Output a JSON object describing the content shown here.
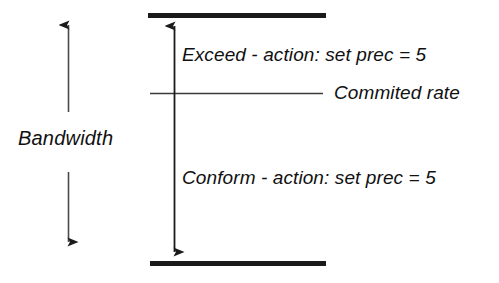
{
  "diagram": {
    "title_text_present": false,
    "labels": {
      "bandwidth": "Bandwidth",
      "exceed_action": "Exceed - action: set prec = 5",
      "conform_action": "Conform - action: set prec = 5",
      "commited_rate": "Commited rate"
    },
    "colors": {
      "ink": "#111111",
      "thin_line": "#3a3a3a",
      "background": "#ffffff"
    },
    "geometry": {
      "top_bar": {
        "x1": 148,
        "x2": 326,
        "y": 15,
        "thickness": 5
      },
      "bottom_bar": {
        "x1": 150,
        "x2": 326,
        "y": 263,
        "thickness": 5
      },
      "commited_rate_line": {
        "x1": 150,
        "x2": 323,
        "y": 93,
        "thickness": 1
      },
      "center_double_arrow": {
        "x": 174,
        "y1": 16,
        "y2": 262
      },
      "bandwidth_arrow_up": {
        "x": 68,
        "y1": 15,
        "y2": 112
      },
      "bandwidth_arrow_down": {
        "x": 68,
        "y1": 172,
        "y2": 252
      }
    }
  }
}
